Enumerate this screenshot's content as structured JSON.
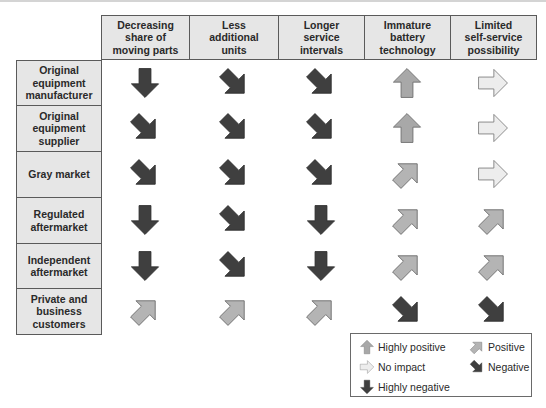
{
  "colors": {
    "highly_negative": "#3f3f3f",
    "negative": "#3f3f3f",
    "highly_positive": "#a8a8a8",
    "positive": "#b4b4b4",
    "no_impact": "#ededed",
    "header_bg": "#e6e6e6",
    "border": "#5a5a5a"
  },
  "columns": [
    {
      "label": "Decreasing share of moving parts",
      "lines": [
        "Decreasing",
        "share of",
        "moving parts"
      ]
    },
    {
      "label": "Less additional units",
      "lines": [
        "Less",
        "additional",
        "units"
      ]
    },
    {
      "label": "Longer service intervals",
      "lines": [
        "Longer",
        "service",
        "intervals"
      ]
    },
    {
      "label": "Immature battery technology",
      "lines": [
        "Immature",
        "battery",
        "technology"
      ]
    },
    {
      "label": "Limited self-service possibility",
      "lines": [
        "Limited",
        "self-service",
        "possibility"
      ]
    }
  ],
  "rows": [
    {
      "label": "Original equipment manufacturer",
      "lines": [
        "Original",
        "equipment",
        "manufacturer"
      ],
      "impacts": [
        "highly_negative",
        "negative",
        "negative",
        "highly_positive",
        "no_impact"
      ]
    },
    {
      "label": "Original equipment supplier",
      "lines": [
        "Original",
        "equipment",
        "supplier"
      ],
      "impacts": [
        "negative",
        "negative",
        "negative",
        "highly_positive",
        "no_impact"
      ]
    },
    {
      "label": "Gray market",
      "lines": [
        "Gray market"
      ],
      "impacts": [
        "negative",
        "negative",
        "negative",
        "positive",
        "no_impact"
      ]
    },
    {
      "label": "Regulated aftermarket",
      "lines": [
        "Regulated",
        "aftermarket"
      ],
      "impacts": [
        "highly_negative",
        "negative",
        "highly_negative",
        "positive",
        "positive"
      ]
    },
    {
      "label": "Independent aftermarket",
      "lines": [
        "Independent",
        "aftermarket"
      ],
      "impacts": [
        "highly_negative",
        "negative",
        "highly_negative",
        "positive",
        "positive"
      ]
    },
    {
      "label": "Private and business customers",
      "lines": [
        "Private and",
        "business",
        "customers"
      ],
      "impacts": [
        "positive",
        "positive",
        "positive",
        "negative",
        "negative"
      ]
    }
  ],
  "legend": {
    "items": [
      {
        "key": "highly_positive",
        "label": "Highly positive",
        "icon": "arrow-up-icon"
      },
      {
        "key": "positive",
        "label": "Positive",
        "icon": "arrow-up-right-icon"
      },
      {
        "key": "no_impact",
        "label": "No impact",
        "icon": "arrow-right-icon"
      },
      {
        "key": "negative",
        "label": "Negative",
        "icon": "arrow-down-right-icon"
      },
      {
        "key": "highly_negative",
        "label": "Highly negative",
        "icon": "arrow-down-icon"
      }
    ]
  }
}
